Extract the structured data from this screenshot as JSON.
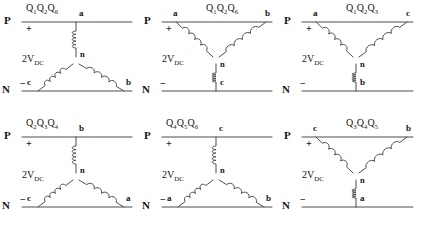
{
  "figure": {
    "background_color": "#ffffff",
    "line_color": "#4d4d4d",
    "text_color": "#141414",
    "columns": 3,
    "rows": 2
  },
  "common": {
    "positive_rail_label": "P",
    "negative_rail_label": "N",
    "plus_sign": "+",
    "minus_sign": "−",
    "voltage_label": "2V",
    "voltage_subscript": "DC",
    "neutral_label": "n"
  },
  "panels": [
    {
      "id": "panel-1",
      "orientation": "tee",
      "states": [
        {
          "device": "Q",
          "index": "1"
        },
        {
          "device": "Q",
          "index": "2"
        },
        {
          "device": "Q",
          "index": "6"
        }
      ],
      "states_text": "Q1Q2Q6",
      "top_terminal": "a",
      "bottom_left_terminal": "c",
      "bottom_right_terminal": "b",
      "voltage_label": "2V",
      "voltage_subscript": "DC",
      "neutral_label": "n",
      "positive_rail_label": "P",
      "negative_rail_label": "N",
      "plus_sign": "+",
      "minus_sign": "−"
    },
    {
      "id": "panel-2",
      "orientation": "wye",
      "states": [
        {
          "device": "Q",
          "index": "1"
        },
        {
          "device": "Q",
          "index": "2"
        },
        {
          "device": "Q",
          "index": "6"
        }
      ],
      "states_text": "Q1Q2Q6",
      "top_left_terminal": "a",
      "top_right_terminal": "b",
      "bottom_terminal": "c",
      "voltage_label": "2V",
      "voltage_subscript": "DC",
      "neutral_label": "n",
      "positive_rail_label": "P",
      "negative_rail_label": "N",
      "plus_sign": "+",
      "minus_sign": "−"
    },
    {
      "id": "panel-3",
      "orientation": "wye",
      "states": [
        {
          "device": "Q",
          "index": "1"
        },
        {
          "device": "Q",
          "index": "2"
        },
        {
          "device": "Q",
          "index": "3"
        }
      ],
      "states_text": "Q1Q2Q3",
      "top_left_terminal": "a",
      "top_right_terminal": "c",
      "bottom_terminal": "b",
      "voltage_label": "2V",
      "voltage_subscript": "DC",
      "neutral_label": "n",
      "positive_rail_label": "P",
      "negative_rail_label": "N",
      "plus_sign": "+",
      "minus_sign": "−"
    },
    {
      "id": "panel-4",
      "orientation": "tee",
      "states": [
        {
          "device": "Q",
          "index": "2"
        },
        {
          "device": "Q",
          "index": "3"
        },
        {
          "device": "Q",
          "index": "4"
        }
      ],
      "states_text": "Q2Q3Q4",
      "top_terminal": "b",
      "bottom_left_terminal": "c",
      "bottom_right_terminal": "a",
      "voltage_label": "2V",
      "voltage_subscript": "DC",
      "neutral_label": "n",
      "positive_rail_label": "P",
      "negative_rail_label": "N",
      "plus_sign": "+",
      "minus_sign": "−"
    },
    {
      "id": "panel-5",
      "orientation": "tee",
      "states": [
        {
          "device": "Q",
          "index": "4"
        },
        {
          "device": "Q",
          "index": "5"
        },
        {
          "device": "Q",
          "index": "6"
        }
      ],
      "states_text": "Q4Q5Q6",
      "top_terminal": "c",
      "bottom_left_terminal": "a",
      "bottom_right_terminal": "b",
      "voltage_label": "2V",
      "voltage_subscript": "DC",
      "neutral_label": "n",
      "positive_rail_label": "P",
      "negative_rail_label": "N",
      "plus_sign": "+",
      "minus_sign": "−"
    },
    {
      "id": "panel-6",
      "orientation": "wye",
      "states": [
        {
          "device": "Q",
          "index": "3"
        },
        {
          "device": "Q",
          "index": "4"
        },
        {
          "device": "Q",
          "index": "5"
        }
      ],
      "states_text": "Q3Q4Q5",
      "top_left_terminal": "c",
      "top_right_terminal": "b",
      "bottom_terminal": "a",
      "voltage_label": "2V",
      "voltage_subscript": "DC",
      "neutral_label": "n",
      "positive_rail_label": "P",
      "negative_rail_label": "N",
      "plus_sign": "+",
      "minus_sign": "−"
    }
  ]
}
